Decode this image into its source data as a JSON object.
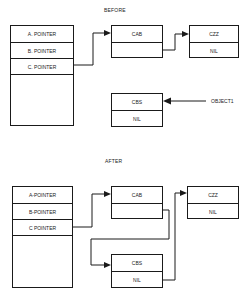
{
  "before": {
    "title": "BEFORE",
    "pointer_table": {
      "rows": [
        "A. POINTER",
        "B. POINTER",
        "C. POINTER",
        ""
      ]
    },
    "cab_node": {
      "value": "CAB",
      "next": ""
    },
    "czz_node": {
      "value": "CZZ",
      "next": "NIL"
    },
    "cbs_node": {
      "value": "CBS",
      "next": "NIL"
    },
    "object_label": "OBJECT1",
    "links": [
      {
        "from": "C. POINTER",
        "to": "CAB"
      },
      {
        "from": "CAB.next",
        "to": "CZZ"
      },
      {
        "from": "OBJECT1",
        "to": "CBS"
      }
    ]
  },
  "after": {
    "title": "AFTER",
    "pointer_table": {
      "rows": [
        "A-POINTER",
        "B-POINTER",
        "C POINTER",
        ""
      ]
    },
    "cab_node": {
      "value": "CAB",
      "next": ""
    },
    "czz_node": {
      "value": "CZZ",
      "next": "NIL"
    },
    "cbs_node": {
      "value": "CBS",
      "next": "NIL"
    },
    "links": [
      {
        "from": "C POINTER",
        "to": "CAB"
      },
      {
        "from": "CAB.next",
        "to": "CBS"
      },
      {
        "from": "CBS.next",
        "to": "CZZ"
      }
    ]
  }
}
